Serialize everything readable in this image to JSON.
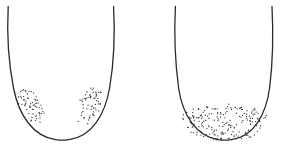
{
  "canvas": {
    "width": 284,
    "height": 146,
    "background_color": "#ffffff",
    "description": "Two stippled U-shaped outline diagrams side by side"
  },
  "style": {
    "stroke_color": "#2b2b2b",
    "stroke_width": 1.3,
    "dot_color": "#1f1f1f",
    "dot_radius": 0.62
  },
  "figures": [
    {
      "id": "left-figure",
      "name": "left-u-shape",
      "label": "Left U-shaped outline with two lateral stipple clusters",
      "outline_path": "M 8.2 6.5 C 7.0 30.0 7.6 58.0 13.5 88.0 C 18.8 115.0 33.0 136.5 55.5 139.6 C 60.0 140.3 64.5 140.3 69.0 139.6 C 91.5 136.5 105.0 115.0 109.6 88.0 C 114.8 58.0 114.8 30.0 113.6 6.5",
      "stipple_clusters": [
        {
          "id": "left-figure-cluster-left",
          "name": "stipple-cluster-left",
          "count": 62,
          "seed": 17,
          "shape": "teardrop",
          "cx": 32.0,
          "cy": 106.0,
          "rx": 13.5,
          "ry": 19.5,
          "rotation": -26,
          "taper": 0.55
        },
        {
          "id": "left-figure-cluster-right",
          "name": "stipple-cluster-right",
          "count": 62,
          "seed": 41,
          "shape": "teardrop",
          "cx": 89.5,
          "cy": 106.0,
          "rx": 13.5,
          "ry": 19.5,
          "rotation": 26,
          "taper": 0.55
        }
      ]
    },
    {
      "id": "right-figure",
      "name": "right-u-shape",
      "label": "Right U-shaped outline with a single full basin stipple band",
      "outline_path": "M 175.4 6.5 C 174.2 30.0 174.6 58.0 178.6 88.0 C 182.4 115.0 196.5 136.5 218.5 139.6 C 222.8 140.3 227.2 140.3 231.5 139.6 C 253.5 136.5 266.0 115.0 269.6 88.0 C 273.4 58.0 273.2 30.0 272.0 6.5",
      "stipple_clusters": [
        {
          "id": "right-figure-cluster-basin",
          "name": "stipple-cluster-basin",
          "count": 188,
          "seed": 73,
          "shape": "basin",
          "cx": 224.5,
          "cy": 122.0,
          "rx": 45.0,
          "ry": 19.0,
          "rotation": 0,
          "taper": 1.0
        }
      ]
    }
  ]
}
